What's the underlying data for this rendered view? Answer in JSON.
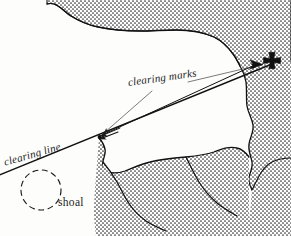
{
  "figure": {
    "kind": "nautical-chart-diagram",
    "width": 291,
    "height": 236,
    "background_color": "#fdfdfb",
    "ink_color": "#1b1b1b",
    "stipple_color": "#2a2a2a"
  },
  "labels": {
    "clearing_marks": "clearing marks",
    "clearing_line": "clearing line",
    "shoal": "shoal"
  },
  "symbols": {
    "church_cross": {
      "name": "church-cross-symbol",
      "x": 272,
      "y": 62
    },
    "beacon_triangle": {
      "name": "beacon-triangle-symbol",
      "x": 258,
      "y": 65
    },
    "headland_point": {
      "name": "headland-point-marker",
      "x": 99,
      "y": 137
    },
    "shoal_circle": {
      "name": "shoal-dashed-circle",
      "cx": 41,
      "cy": 190,
      "r": 20,
      "dash": "5 4"
    }
  },
  "lines": {
    "clearing_line": {
      "name": "clearing-line",
      "from": [
        -6,
        177
      ],
      "to": [
        277,
        62
      ],
      "width": 1.25
    },
    "transit_upper": {
      "name": "transit-line-upper",
      "from": [
        99,
        137
      ],
      "to": [
        262,
        63
      ],
      "width": 1.0
    },
    "leader_to_point": {
      "name": "leader-line-to-headland",
      "from": [
        150,
        90
      ],
      "to": [
        101,
        136
      ],
      "width": 0.6
    },
    "leader_to_mark": {
      "name": "leader-line-to-mark",
      "from": [
        186,
        81
      ],
      "to": [
        250,
        67
      ],
      "width": 0.6
    }
  },
  "coastlines": {
    "north_land": {
      "name": "north-landmass",
      "description": "upper coastline sweeping from top-left to the right margin"
    },
    "east_land": {
      "name": "east-landmass",
      "description": "right-hand coastline running down the eastern margin"
    },
    "south_land": {
      "name": "south-landmass",
      "description": "lower headland and spit south of the clearing line"
    }
  }
}
